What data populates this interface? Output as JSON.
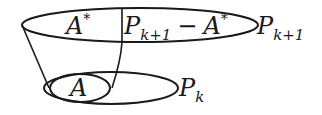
{
  "diagram": {
    "colors": {
      "stroke": "#1a1a1a",
      "background": "#ffffff"
    },
    "top_ellipse": {
      "left_region_label": {
        "base": "A",
        "sup": "*"
      },
      "right_region_label": {
        "base": "P",
        "sub": "k+1",
        "op": "−",
        "base2": "A",
        "sup2": "*"
      },
      "outer_label": {
        "base": "P",
        "sub": "k+1"
      }
    },
    "bottom_ellipse": {
      "inner_label": {
        "base": "A"
      },
      "outer_label": {
        "base": "P",
        "sub": "k"
      }
    }
  }
}
